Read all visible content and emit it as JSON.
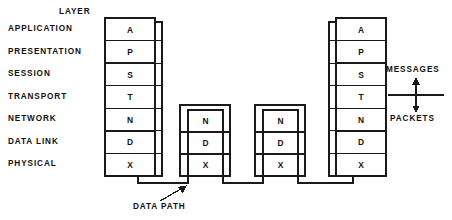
{
  "diagram": {
    "header": {
      "layer_heading": "LAYER"
    },
    "layer_labels": [
      "APPLICATION",
      "PRESENTATION",
      "SESSION",
      "TRANSPORT",
      "NETWORK",
      "DATA LINK",
      "PHYSICAL"
    ],
    "stacks": {
      "left_host": {
        "name": "left-host-stack",
        "cells": [
          "A",
          "P",
          "S",
          "T",
          "N",
          "D",
          "X"
        ]
      },
      "right_host": {
        "name": "right-host-stack",
        "cells": [
          "A",
          "P",
          "S",
          "T",
          "N",
          "D",
          "X"
        ]
      },
      "router_one": {
        "name": "first-intermediate-node-stack",
        "cells": [
          "N",
          "D",
          "X"
        ]
      },
      "router_two": {
        "name": "second-intermediate-node-stack",
        "cells": [
          "N",
          "D",
          "X"
        ]
      }
    },
    "annotations": {
      "data_path": "DATA PATH",
      "messages": "MESSAGES",
      "packets": "PACKETS"
    },
    "colors": {
      "stroke": "#1a1a1a",
      "text": "#111111",
      "background": "#ffffff"
    }
  }
}
